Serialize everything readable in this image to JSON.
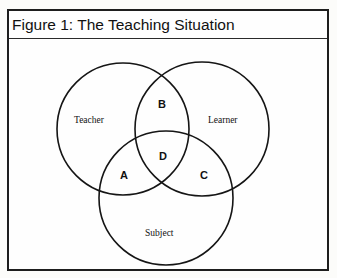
{
  "figure": {
    "title": "Figure 1: The Teaching Situation"
  },
  "diagram": {
    "type": "venn",
    "sets": [
      {
        "name": "Teacher",
        "label": "Teacher"
      },
      {
        "name": "Learner",
        "label": "Learner"
      },
      {
        "name": "Subject",
        "label": "Subject"
      }
    ],
    "regions": [
      {
        "id": "A",
        "label": "A",
        "sets": [
          "Teacher",
          "Subject"
        ]
      },
      {
        "id": "B",
        "label": "B",
        "sets": [
          "Teacher",
          "Learner"
        ]
      },
      {
        "id": "C",
        "label": "C",
        "sets": [
          "Learner",
          "Subject"
        ]
      },
      {
        "id": "D",
        "label": "D",
        "sets": [
          "Teacher",
          "Learner",
          "Subject"
        ]
      }
    ]
  }
}
